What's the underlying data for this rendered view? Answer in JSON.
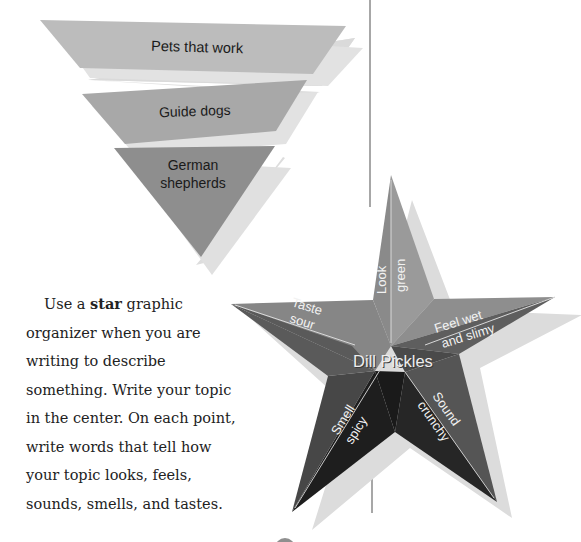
{
  "funnel": {
    "levels": [
      {
        "label_lines": [
          "Pets that work"
        ],
        "fill": "#b8b8b8"
      },
      {
        "label_lines": [
          "Guide dogs"
        ],
        "fill": "#a3a3a3"
      },
      {
        "label_lines": [
          "German",
          "shepherds"
        ],
        "fill": "#8c8c8c"
      }
    ]
  },
  "paragraph": {
    "prefix": "Use a ",
    "bold": "star",
    "suffix": " graphic organizer when you are writing to describe something. Write your topic in the center. On each point, write words that tell how your topic looks, feels, sounds, smells, and tastes."
  },
  "star": {
    "center_label": "Dill Pickles",
    "points": [
      {
        "sense": "Look",
        "detail": "green"
      },
      {
        "sense": "Feel wet",
        "detail": "and slimy"
      },
      {
        "sense": "Sound",
        "detail": "crunchy"
      },
      {
        "sense": "Smell",
        "detail": "spicy"
      },
      {
        "sense": "Taste",
        "detail": "sour"
      }
    ]
  },
  "colors": {
    "divider": "#8a8a8a",
    "shadow": "#dcdcdc",
    "text_on_dark": "#f2f2f2"
  }
}
